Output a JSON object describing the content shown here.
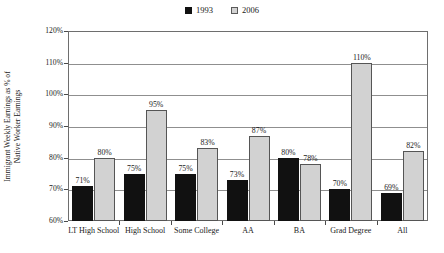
{
  "chart_data": {
    "type": "bar",
    "title": "",
    "subtitle": "",
    "xlabel": "",
    "ylabel": "Immigrant Weekly Earnings as % of Native Worker Earnings",
    "ylabel_lines": [
      "Immigrant Weekly Earnings as % of",
      "Native Worker Earnings"
    ],
    "categories": [
      "LT High School",
      "High School",
      "Some College",
      "AA",
      "BA",
      "Grad Degree",
      "All"
    ],
    "series": [
      {
        "name": "1993",
        "color": "#111111",
        "values": [
          71,
          75,
          75,
          73,
          80,
          70,
          69
        ],
        "labels": [
          "71%",
          "75%",
          "75%",
          "73%",
          "80%",
          "70%",
          "69%"
        ]
      },
      {
        "name": "2006",
        "color": "#d2d2d2",
        "values": [
          80,
          95,
          83,
          87,
          78,
          110,
          82
        ],
        "labels": [
          "80%",
          "95%",
          "83%",
          "87%",
          "78%",
          "110%",
          "82%"
        ]
      }
    ],
    "ylim": [
      60,
      120
    ],
    "ytick_values": [
      60,
      70,
      80,
      90,
      100,
      110,
      120
    ],
    "ytick_labels": [
      "60%",
      "70%",
      "80%",
      "90%",
      "100%",
      "110%",
      "120%"
    ],
    "grid": true,
    "legend_position": "top-center",
    "value_labels_shown": true
  },
  "legend": {
    "entries": [
      {
        "label": "1993",
        "swatch": "filled-black-square-icon"
      },
      {
        "label": "2006",
        "swatch": "light-gray-square-icon"
      }
    ]
  }
}
